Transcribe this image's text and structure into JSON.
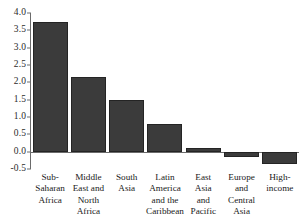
{
  "chart_data": {
    "type": "bar",
    "title": "",
    "subtitle": "",
    "xlabel": "",
    "ylabel": "",
    "categories": [
      "Sub-\nSaharan\nAfrica",
      "Middle\nEast and\nNorth\nAfrica",
      "South\nAsia",
      "Latin\nAmerica\nand the\nCaribbean",
      "East\nAsia\nand\nPacific",
      "Europe\nand\nCentral\nAsia",
      "High-\nincome"
    ],
    "values": [
      3.75,
      2.15,
      1.5,
      0.8,
      0.1,
      -0.15,
      -0.35
    ],
    "ylim": [
      -0.5,
      4.0
    ],
    "yticks": [
      "4.0",
      "3.5",
      "3.0",
      "2.5",
      "2.0",
      "1.5",
      "1.0",
      "0.5",
      "0.0",
      "-0.5"
    ],
    "ytick_values": [
      4.0,
      3.5,
      3.0,
      2.5,
      2.0,
      1.5,
      1.0,
      0.5,
      0.0,
      -0.5
    ],
    "grid": false,
    "legend": false,
    "legend_position": "none",
    "bar_color": "#3b3b3b",
    "bar_edge_color": "#242424",
    "axis_color": "#6b6b6b"
  }
}
